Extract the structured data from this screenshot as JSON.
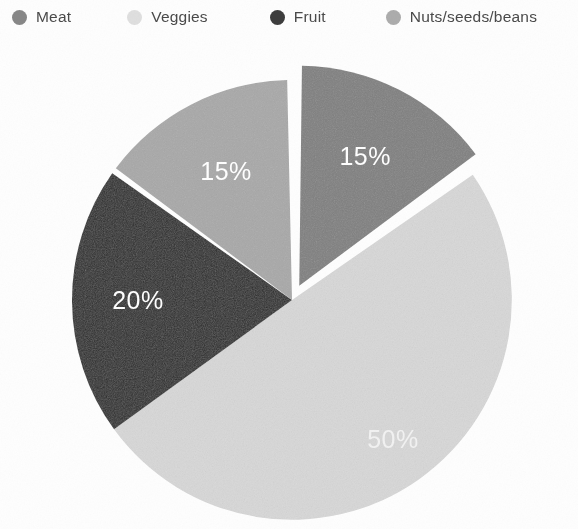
{
  "chart_data": {
    "type": "pie",
    "title": "",
    "categories": [
      "Meat",
      "Veggies",
      "Fruit",
      "Nuts/seeds/beans"
    ],
    "values": [
      15,
      50,
      20,
      15
    ],
    "value_unit": "%",
    "data_labels": [
      "15%",
      "50%",
      "20%",
      "15%"
    ],
    "colors": [
      "#808080",
      "#d9d9d9",
      "#2b2b2b",
      "#a9a9a9"
    ],
    "legend_position": "top",
    "grid": false,
    "start_angle_deg": 0,
    "direction": "clockwise",
    "exploded_slices": [
      "Meat"
    ],
    "slices": [
      {
        "name": "Meat",
        "value": 15,
        "label": "15%",
        "color": "#808080",
        "exploded": true,
        "start_deg": 0,
        "end_deg": 54
      },
      {
        "name": "Veggies",
        "value": 50,
        "label": "50%",
        "color": "#d9d9d9",
        "exploded": false,
        "start_deg": 54,
        "end_deg": 234
      },
      {
        "name": "Fruit",
        "value": 20,
        "label": "20%",
        "color": "#2b2b2b",
        "exploded": false,
        "start_deg": 234,
        "end_deg": 306
      },
      {
        "name": "Nuts/seeds/beans",
        "value": 15,
        "label": "15%",
        "color": "#a9a9a9",
        "exploded": false,
        "start_deg": 306,
        "end_deg": 360
      }
    ]
  },
  "legend": {
    "items": [
      {
        "label": "Meat",
        "color": "#7e7e7e",
        "marker": "circle-marker"
      },
      {
        "label": "Veggies",
        "color": "#dcdcdc",
        "marker": "circle-marker"
      },
      {
        "label": "Fruit",
        "color": "#2d2d2d",
        "marker": "circle-marker"
      },
      {
        "label": "Nuts/seeds/beans",
        "color": "#a6a6a6",
        "marker": "circle-marker"
      }
    ]
  },
  "labels": {
    "meat_pct": "15%",
    "veggies_pct": "50%",
    "fruit_pct": "20%",
    "nuts_pct": "15%"
  }
}
